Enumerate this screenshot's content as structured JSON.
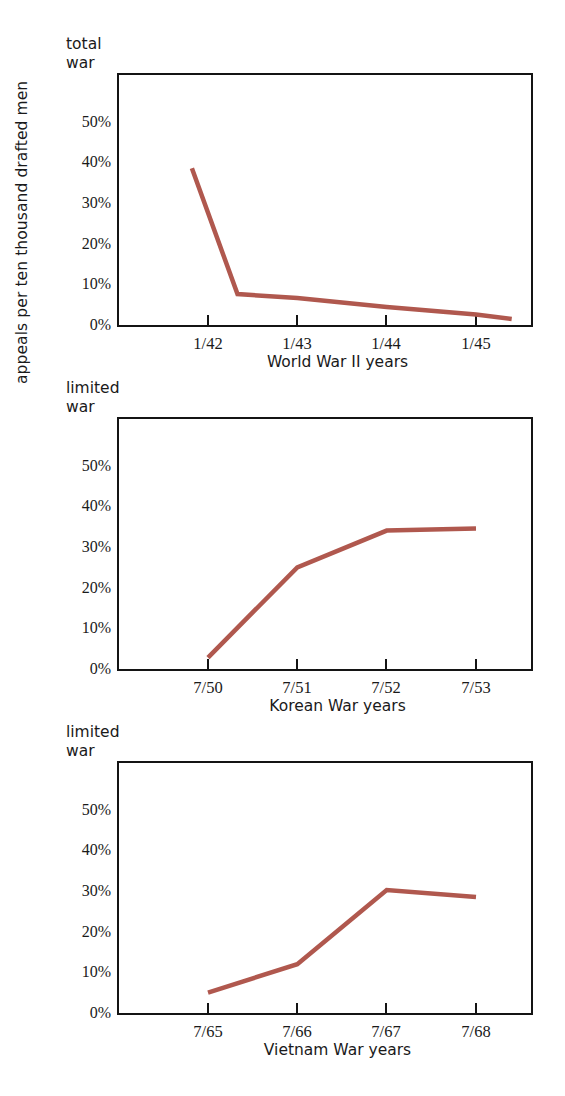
{
  "figure": {
    "y_axis_label": "appeals per ten thousand drafted men",
    "line_color": "#b0584e",
    "frame_color": "#141414"
  },
  "chart_data": [
    {
      "type": "line",
      "title": "total war",
      "title_line1": "total",
      "title_line2": "war",
      "xlabel": "World War II years",
      "ylabel": "appeals per ten thousand drafted men",
      "categories": [
        "1/42",
        "1/43",
        "1/44",
        "1/45"
      ],
      "yticks": [
        "0%",
        "10%",
        "20%",
        "30%",
        "40%",
        "50%"
      ],
      "ytick_values": [
        0,
        10,
        20,
        30,
        40,
        50
      ],
      "ylim": [
        0,
        58
      ],
      "grid": false,
      "legend": "none",
      "x": [
        41.82,
        42.33,
        43.0,
        44.0,
        45.0,
        45.4
      ],
      "values": [
        38.5,
        7.6,
        6.6,
        4.4,
        2.6,
        1.5
      ],
      "point_labels": [
        "late 1941",
        "mid 1942",
        "1/43",
        "1/44",
        "1/45",
        "mid 1945"
      ]
    },
    {
      "type": "line",
      "title": "limited war",
      "title_line1": "limited",
      "title_line2": "war",
      "xlabel": "Korean War years",
      "ylabel": "appeals per ten thousand drafted men",
      "categories": [
        "7/50",
        "7/51",
        "7/52",
        "7/53"
      ],
      "yticks": [
        "0%",
        "10%",
        "20%",
        "30%",
        "40%",
        "50%"
      ],
      "ytick_values": [
        0,
        10,
        20,
        30,
        40,
        50
      ],
      "ylim": [
        0,
        58
      ],
      "grid": false,
      "legend": "none",
      "x": [
        50.0,
        51.0,
        52.0,
        53.0
      ],
      "values": [
        2.8,
        25.0,
        34.0,
        34.5
      ]
    },
    {
      "type": "line",
      "title": "limited war",
      "title_line1": "limited",
      "title_line2": "war",
      "xlabel": "Vietnam War years",
      "ylabel": "appeals per ten thousand drafted men",
      "categories": [
        "7/65",
        "7/66",
        "7/67",
        "7/68"
      ],
      "yticks": [
        "0%",
        "10%",
        "20%",
        "30%",
        "40%",
        "50%"
      ],
      "ytick_values": [
        0,
        10,
        20,
        30,
        40,
        50
      ],
      "ylim": [
        0,
        58
      ],
      "grid": false,
      "legend": "none",
      "x": [
        65.0,
        66.0,
        67.0,
        68.0
      ],
      "values": [
        5.0,
        12.0,
        30.2,
        28.5
      ]
    }
  ]
}
